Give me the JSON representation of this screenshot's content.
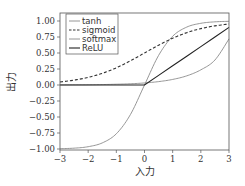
{
  "chart_data": {
    "type": "line",
    "title": "",
    "xlabel": "入力",
    "ylabel": "出力",
    "xlim": [
      -3,
      3
    ],
    "ylim": [
      -1.0,
      1.125
    ],
    "grid": false,
    "legend_position": "upper left",
    "xticks": [
      -3,
      -2,
      -1,
      0,
      1,
      2,
      3
    ],
    "xtick_labels": [
      "−3",
      "−2",
      "−1",
      "0",
      "1",
      "2",
      "3"
    ],
    "yticks": [
      1.0,
      0.75,
      0.5,
      0.25,
      0.0,
      -0.25,
      -0.5,
      -0.75,
      -1.0
    ],
    "ytick_labels": [
      "1.00",
      "0.75",
      "0.50",
      "0.25",
      "0.00",
      "−0.25",
      "−0.50",
      "−0.75",
      "−1.00"
    ],
    "x": [
      -3,
      -2.5,
      -2,
      -1.5,
      -1,
      -0.5,
      0,
      0.5,
      1,
      1.5,
      2,
      2.5,
      3
    ],
    "series": [
      {
        "name": "tanh",
        "style": "solid",
        "color": "#8a8a8a",
        "width": 0.9,
        "values": [
          -0.995,
          -0.987,
          -0.964,
          -0.905,
          -0.762,
          -0.462,
          0.0,
          0.462,
          0.762,
          0.905,
          0.964,
          0.987,
          0.995
        ]
      },
      {
        "name": "sigmoid",
        "style": "dashed",
        "color": "#333333",
        "width": 1.1,
        "values": [
          0.047,
          0.076,
          0.119,
          0.182,
          0.269,
          0.378,
          0.5,
          0.622,
          0.731,
          0.818,
          0.881,
          0.924,
          0.953
        ]
      },
      {
        "name": "softmax",
        "style": "solid",
        "color": "#8a8a8a",
        "width": 0.9,
        "values": [
          0.002,
          0.003,
          0.004,
          0.007,
          0.012,
          0.019,
          0.032,
          0.053,
          0.087,
          0.143,
          0.237,
          0.39,
          0.72
        ]
      },
      {
        "name": "ReLU",
        "style": "solid",
        "color": "#222222",
        "width": 1.1,
        "values": [
          0.0,
          0.0,
          0.0,
          0.0,
          0.0,
          0.0,
          0.0,
          0.15,
          0.3,
          0.45,
          0.6,
          0.75,
          0.9
        ]
      }
    ]
  },
  "legend": {
    "items": [
      "tanh",
      "sigmoid",
      "softmax",
      "ReLU"
    ]
  },
  "axes": {
    "xlabel": "入力",
    "ylabel": "出力"
  }
}
